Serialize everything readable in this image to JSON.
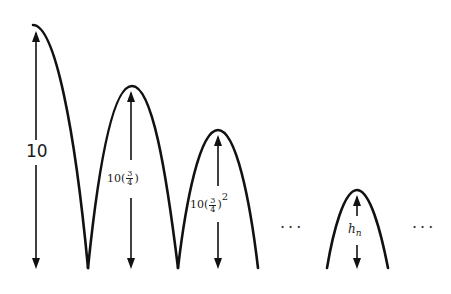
{
  "figure": {
    "bounces": [
      {
        "label_full": "10",
        "label_base": "10",
        "height_value": 10
      },
      {
        "label_full": "10(3/4)",
        "label_base": "10(",
        "frac_num": "3",
        "frac_den": "4",
        "label_close": ")",
        "exponent": ""
      },
      {
        "label_full": "10(3/4)^2",
        "label_base": "10(",
        "frac_num": "3",
        "frac_den": "4",
        "label_close": ")",
        "exponent": "2"
      },
      {
        "label_full": "h_n",
        "label_var": "h",
        "label_sub": "n"
      }
    ],
    "ellipsis_left": "···",
    "ellipsis_right": "···",
    "stroke_color": "#111111",
    "background_color": "#ffffff"
  }
}
